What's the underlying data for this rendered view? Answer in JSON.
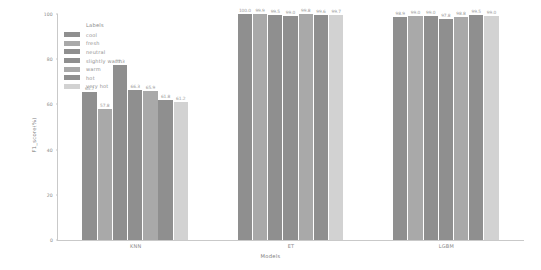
{
  "chart_data": {
    "type": "bar",
    "title": "",
    "xlabel": "Models",
    "ylabel": "F1_score(%)",
    "ylim": [
      0,
      100
    ],
    "yticks": [
      "0",
      "20",
      "40",
      "60",
      "80",
      "100"
    ],
    "grid": false,
    "legend": {
      "title": "Labels",
      "position": "upper-left-inside",
      "entries": [
        "cool",
        "fresh",
        "neutral",
        "slightly warm",
        "warm",
        "hot",
        "very hot"
      ]
    },
    "categories": [
      "KNN",
      "ET",
      "LGBM"
    ],
    "series": [
      {
        "name": "cool",
        "color": "#8f8f8f",
        "values": [
          65.7,
          100.0,
          98.9
        ]
      },
      {
        "name": "fresh",
        "color": "#a9a9a9",
        "values": [
          57.8,
          99.9,
          99.0
        ]
      },
      {
        "name": "neutral",
        "color": "#8f8f8f",
        "values": [
          77.3,
          99.5,
          99.0
        ]
      },
      {
        "name": "slightly warm",
        "color": "#8f8f8f",
        "values": [
          66.3,
          99.0,
          97.8
        ]
      },
      {
        "name": "warm",
        "color": "#a9a9a9",
        "values": [
          65.9,
          99.8,
          98.8
        ]
      },
      {
        "name": "hot",
        "color": "#8f8f8f",
        "values": [
          61.8,
          99.6,
          99.5
        ]
      },
      {
        "name": "very hot",
        "color": "#d2d2d2",
        "values": [
          61.2,
          99.7,
          99.0
        ]
      }
    ],
    "bar_value_labels": {
      "KNN": [
        "65.7",
        "57.8",
        "77.3",
        "66.3",
        "65.9",
        "61.8",
        "61.2"
      ],
      "ET": [
        "100.0",
        "99.9",
        "99.5",
        "99.0",
        "99.8",
        "99.6",
        "99.7"
      ],
      "LGBM": [
        "98.9",
        "99.0",
        "99.0",
        "97.8",
        "98.8",
        "99.5",
        "99.0"
      ]
    }
  }
}
